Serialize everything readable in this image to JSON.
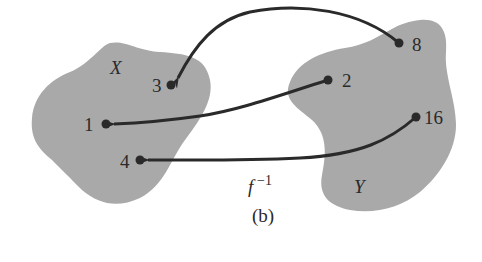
{
  "figure": {
    "caption": "(b)",
    "function_label": "f",
    "function_exponent": "−1",
    "colors": {
      "blob_fill": "#a9a9a9",
      "ink": "#2a2a2a",
      "background": "#ffffff"
    }
  },
  "sets": {
    "domain": {
      "name": "X",
      "elements": [
        {
          "label": "3"
        },
        {
          "label": "1"
        },
        {
          "label": "4"
        }
      ]
    },
    "codomain": {
      "name": "Y",
      "elements": [
        {
          "label": "8"
        },
        {
          "label": "2"
        },
        {
          "label": "16"
        }
      ]
    }
  },
  "mappings": [
    {
      "from": "8",
      "to": "3"
    },
    {
      "from": "2",
      "to": "1"
    },
    {
      "from": "16",
      "to": "4"
    }
  ]
}
